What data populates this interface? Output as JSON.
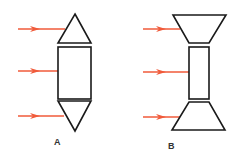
{
  "figure": {
    "colors": {
      "arrow": "#f05a3a",
      "outline": "#1a1a1a",
      "background": "#ffffff"
    },
    "panels": [
      {
        "id": "A",
        "label": "A",
        "description": "Rectangle capped by pointed triangles at top and bottom, with three incoming arrows from the left",
        "arrows": [
          {
            "x1": 18,
            "y": 29,
            "x2": 65
          },
          {
            "x1": 18,
            "y": 71,
            "x2": 58
          },
          {
            "x1": 18,
            "y": 116,
            "x2": 64
          }
        ],
        "shapes": {
          "top_triangle": "75,14 91,43 58,43",
          "rectangle": {
            "x": 58,
            "y": 47,
            "w": 33,
            "h": 52
          },
          "bottom_triangle": "58,101 91,101 75,131"
        },
        "label_pos": {
          "x": 54,
          "y": 137
        }
      },
      {
        "id": "B",
        "label": "B",
        "description": "Rectangle capped by inverted trapezoids (flared ends) at top and bottom, with three incoming arrows from the left",
        "arrows": [
          {
            "x1": 143,
            "y": 29,
            "x2": 180
          },
          {
            "x1": 143,
            "y": 72,
            "x2": 189
          },
          {
            "x1": 143,
            "y": 117,
            "x2": 180
          }
        ],
        "shapes": {
          "top_trapezoid": "173,15 226,15 209,43 189,43",
          "rectangle": {
            "x": 189,
            "y": 47,
            "w": 20,
            "h": 52
          },
          "bottom_trapezoid": "189,102 209,102 225,130 172,130"
        },
        "label_pos": {
          "x": 168,
          "y": 141
        }
      }
    ]
  }
}
